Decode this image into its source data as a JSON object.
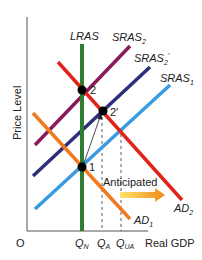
{
  "diagram": {
    "type": "AS-AD model",
    "y_axis_label": "Price Level",
    "x_axis_label": "Real GDP",
    "origin_label": "O",
    "x_ticks": [
      {
        "main": "Q",
        "sub": "N"
      },
      {
        "main": "Q",
        "sub": "A"
      },
      {
        "main": "Q",
        "sub": "UA"
      }
    ],
    "curves": {
      "lras": {
        "label": "LRAS",
        "color": "#2e7d32"
      },
      "sras2": {
        "main": "SRAS",
        "sub": "2",
        "color": "#8b1a5a"
      },
      "sras2p": {
        "main": "SRAS",
        "sub": "2",
        "prime": "′",
        "color": "#2e2f7a"
      },
      "sras1": {
        "main": "SRAS",
        "sub": "1",
        "color": "#3a9be0"
      },
      "ad2": {
        "main": "AD",
        "sub": "2",
        "color": "#e0241c"
      },
      "ad1": {
        "main": "AD",
        "sub": "1",
        "color": "#f07a20"
      }
    },
    "points": [
      {
        "label": "1"
      },
      {
        "label": "2"
      },
      {
        "label": "2′"
      }
    ],
    "annotation": "Anticipated"
  }
}
